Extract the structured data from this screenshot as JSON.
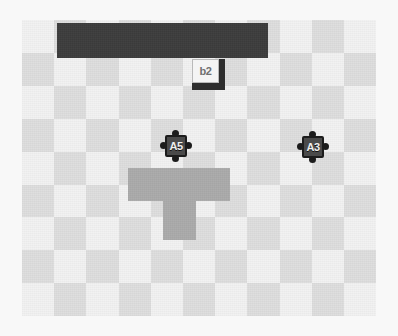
{
  "scene": {
    "width": 398,
    "height": 336,
    "background_color": "#f8f8f8",
    "title": "grid-world-scene"
  },
  "board": {
    "x": 22,
    "y": 20,
    "width": 354,
    "height": 296,
    "columns": 11,
    "rows": 9,
    "cell_width": 32.2,
    "cell_height": 32.9,
    "light_color": "#f2f2f2",
    "dark_color": "#dedede",
    "pattern": "checkerboard"
  },
  "walls": [
    {
      "name": "top-wall-bar",
      "x": 57,
      "y": 23,
      "width": 211,
      "height": 35,
      "color": "#3c3c3c"
    }
  ],
  "regions": [
    {
      "name": "center-cross-region",
      "color": "#ababab",
      "tiles": [
        {
          "x": 128,
          "y": 168,
          "width": 35,
          "height": 33
        },
        {
          "x": 163,
          "y": 168,
          "width": 33,
          "height": 33
        },
        {
          "x": 196,
          "y": 168,
          "width": 34,
          "height": 33
        },
        {
          "x": 163,
          "y": 201,
          "width": 33,
          "height": 39
        }
      ]
    }
  ],
  "crates": [
    {
      "name": "crate-b2",
      "label": "b2",
      "x": 192,
      "y": 59,
      "width": 33,
      "height": 31,
      "face_color": "#f4f4f4",
      "shadow_color": "#2e2e2e",
      "label_color": "#6f6f6f"
    }
  ],
  "tokens": [
    {
      "name": "puzzle-token-a5",
      "label": "A5",
      "x": 160,
      "y": 130,
      "size": 32,
      "body_color": "#4a4a4a",
      "outline_color": "#1c1c1c",
      "label_color": "#efefef"
    },
    {
      "name": "puzzle-token-a3",
      "label": "A3",
      "x": 297,
      "y": 131,
      "size": 32,
      "body_color": "#4a4a4a",
      "outline_color": "#1c1c1c",
      "label_color": "#efefef"
    }
  ]
}
